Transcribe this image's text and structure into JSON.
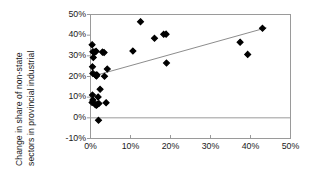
{
  "chart_data": {
    "type": "scatter",
    "title": "",
    "xlabel": "",
    "ylabel": "Change in share of non-state sectors in provincial industrial output",
    "ylabel_lines": [
      "Change in share of non-state",
      "sectors in provincial industrial",
      "output"
    ],
    "xlim": [
      0,
      50
    ],
    "ylim": [
      -10,
      50
    ],
    "xticks": [
      0,
      10,
      20,
      30,
      40,
      50
    ],
    "yticks": [
      -10,
      0,
      10,
      20,
      30,
      40,
      50
    ],
    "xtick_labels": [
      "0%",
      "10%",
      "20%",
      "30%",
      "40%",
      "50%"
    ],
    "ytick_labels": [
      "-10%",
      "0%",
      "10%",
      "20%",
      "30%",
      "40%",
      "50%"
    ],
    "grid": false,
    "legend": null,
    "marker": "diamond",
    "marker_color": "#000000",
    "frame_color": "#9a9a9a",
    "zero_line_color": "#9a9a9a",
    "points": [
      {
        "x": 0.4,
        "y": 35.4
      },
      {
        "x": 0.6,
        "y": 32.0
      },
      {
        "x": 1.1,
        "y": 31.9
      },
      {
        "x": 1.4,
        "y": 32.2
      },
      {
        "x": 3.0,
        "y": 31.8
      },
      {
        "x": 3.4,
        "y": 31.6
      },
      {
        "x": 0.7,
        "y": 29.2
      },
      {
        "x": 0.5,
        "y": 24.7
      },
      {
        "x": 4.2,
        "y": 23.6
      },
      {
        "x": 0.6,
        "y": 21.5
      },
      {
        "x": 1.3,
        "y": 20.6
      },
      {
        "x": 1.6,
        "y": 20.8
      },
      {
        "x": 1.5,
        "y": 20.3
      },
      {
        "x": 3.5,
        "y": 20.1
      },
      {
        "x": 2.4,
        "y": 13.8
      },
      {
        "x": 0.5,
        "y": 11.0
      },
      {
        "x": 1.9,
        "y": 10.1
      },
      {
        "x": 0.6,
        "y": 8.6
      },
      {
        "x": 0.4,
        "y": 7.4
      },
      {
        "x": 1.2,
        "y": 6.4
      },
      {
        "x": 1.5,
        "y": 6.1
      },
      {
        "x": 1.7,
        "y": 6.6
      },
      {
        "x": 2.1,
        "y": 6.9
      },
      {
        "x": 3.9,
        "y": 7.3
      },
      {
        "x": 2.0,
        "y": -1.2
      },
      {
        "x": 10.6,
        "y": 32.3
      },
      {
        "x": 12.5,
        "y": 46.5
      },
      {
        "x": 16.0,
        "y": 38.5
      },
      {
        "x": 18.3,
        "y": 40.4
      },
      {
        "x": 18.9,
        "y": 40.5
      },
      {
        "x": 19.0,
        "y": 26.5
      },
      {
        "x": 37.4,
        "y": 36.6
      },
      {
        "x": 39.3,
        "y": 30.7
      },
      {
        "x": 43.0,
        "y": 43.3
      }
    ],
    "trendline": {
      "x_start": 1.0,
      "y_start": 20.4,
      "x_end": 44.0,
      "y_end": 43.6,
      "color": "#6e6e6e",
      "width": 0.8
    }
  }
}
